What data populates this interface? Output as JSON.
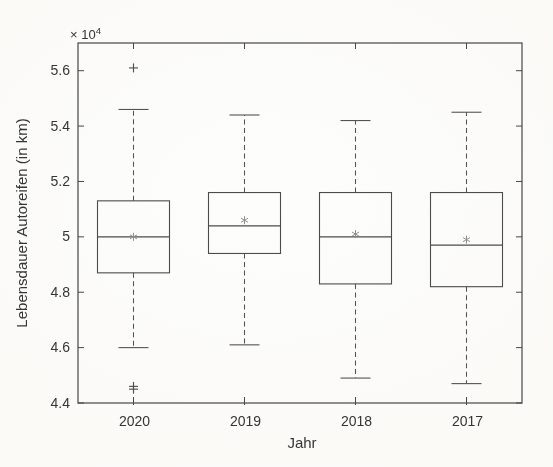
{
  "figure": {
    "background_color": "#faf9f6"
  },
  "style": {
    "frame_color": "#454545",
    "box_color": "#4a4a4a",
    "whisker_color": "#525252",
    "outlier_color": "#4f4f4f",
    "mean_marker_color": "#8f8f8f",
    "text_color": "#333333"
  },
  "chart_data": {
    "type": "boxplot",
    "title": "",
    "xlabel": "Jahr",
    "ylabel": "Lebensdauer Autoreifen (in km)",
    "axis_offset": {
      "base": "× 10",
      "exponent": "4"
    },
    "categories": [
      "2020",
      "2019",
      "2018",
      "2017"
    ],
    "ylim": [
      4.4,
      5.7
    ],
    "yticks": [
      5.6,
      5.4,
      5.2,
      5.0,
      4.8,
      4.6,
      4.4
    ],
    "ytick_labels": [
      "5.6",
      "5.4",
      "5.2",
      "5",
      "4.8",
      "4.6",
      "4.4"
    ],
    "grid": false,
    "legend": "none",
    "marker_glyphs": {
      "mean": "*",
      "outlier": "+"
    },
    "series": [
      {
        "category": "2020",
        "whisker_low": 4.6,
        "q1": 4.87,
        "median": 5.0,
        "q3": 5.13,
        "whisker_high": 5.46,
        "mean": 5.0,
        "outliers": [
          5.61,
          4.46,
          4.45
        ]
      },
      {
        "category": "2019",
        "whisker_low": 4.61,
        "q1": 4.94,
        "median": 5.04,
        "q3": 5.16,
        "whisker_high": 5.44,
        "mean": 5.06,
        "outliers": []
      },
      {
        "category": "2018",
        "whisker_low": 4.49,
        "q1": 4.83,
        "median": 5.0,
        "q3": 5.16,
        "whisker_high": 5.42,
        "mean": 5.01,
        "outliers": []
      },
      {
        "category": "2017",
        "whisker_low": 4.47,
        "q1": 4.82,
        "median": 4.97,
        "q3": 5.16,
        "whisker_high": 5.45,
        "mean": 4.99,
        "outliers": []
      }
    ]
  }
}
